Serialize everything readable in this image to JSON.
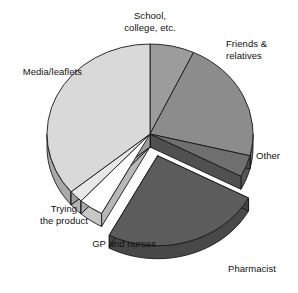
{
  "chart_data": {
    "type": "pie",
    "title": "",
    "subtitle": "",
    "xlabel": "",
    "ylabel": "",
    "legend_position": "none",
    "grid": false,
    "style": "3d-exploded-pie",
    "categories": [
      "School, college, etc.",
      "Friends & relatives",
      "Other",
      "Pharmacist",
      "GP and nurses",
      "Trying the product",
      "Media/leaflets"
    ],
    "values": [
      7,
      22,
      4,
      25,
      4,
      2,
      36
    ],
    "unit": "percent",
    "slices": [
      {
        "label": "School,\ncollege, etc.",
        "label_flat": "School, college, etc.",
        "value": 7,
        "start_angle": 0,
        "end_angle": 25,
        "color": "#9c9c9c",
        "exploded": false
      },
      {
        "label": "Friends &\nrelatives",
        "label_flat": "Friends & relatives",
        "value": 22,
        "start_angle": 25,
        "end_angle": 104,
        "color": "#8c8c8c",
        "exploded": false
      },
      {
        "label": "Other",
        "label_flat": "Other",
        "value": 4,
        "start_angle": 104,
        "end_angle": 118,
        "color": "#6f6f6f",
        "exploded": false
      },
      {
        "label": "Pharmacist",
        "label_flat": "Pharmacist",
        "value": 25,
        "start_angle": 118,
        "end_angle": 208,
        "color": "#5c5c5c",
        "exploded": true
      },
      {
        "label": "GP and nurses",
        "label_flat": "GP and nurses",
        "value": 4,
        "start_angle": 208,
        "end_angle": 222,
        "color": "#ffffff",
        "exploded": false
      },
      {
        "label": "Trying\nthe product",
        "label_flat": "Trying the product",
        "value": 2,
        "start_angle": 222,
        "end_angle": 230,
        "color": "#e8e8e8",
        "exploded": false
      },
      {
        "label": "Media/leaflets",
        "label_flat": "Media/leaflets",
        "value": 36,
        "start_angle": 230,
        "end_angle": 360,
        "color": "#d9d9d9",
        "exploded": false
      }
    ],
    "colors": {
      "school": "#9c9c9c",
      "friends": "#8c8c8c",
      "other": "#6f6f6f",
      "pharmacist": "#5c5c5c",
      "gp": "#ffffff",
      "trying": "#e8e8e8",
      "media": "#d9d9d9",
      "outline": "#1a1a1a",
      "background": "#ffffff"
    }
  },
  "labels": {
    "school": "School,\ncollege, etc.",
    "friends": "Friends &\nrelatives",
    "other": "Other",
    "pharmacist": "Pharmacist",
    "gp_nurses": "GP and nurses",
    "trying": "Trying\nthe product",
    "media": "Media/leaflets"
  }
}
